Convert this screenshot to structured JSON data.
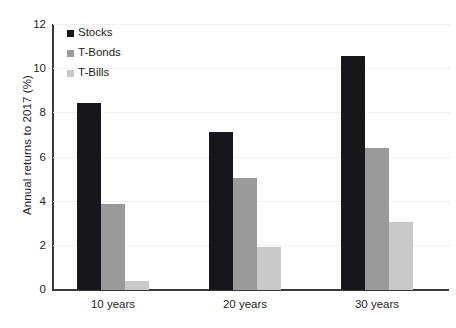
{
  "chart_data": {
    "type": "bar",
    "title": "",
    "subtitle": "",
    "xlabel": "",
    "ylabel": "Annual returns to 2017 (%)",
    "categories": [
      "10 years",
      "20 years",
      "30 years"
    ],
    "series": [
      {
        "name": "Stocks",
        "color": "#17161a",
        "values": [
          8.45,
          7.15,
          10.6
        ]
      },
      {
        "name": "T-Bonds",
        "color": "#9a9a9a",
        "values": [
          3.9,
          5.05,
          6.45
        ]
      },
      {
        "name": "T-Bills",
        "color": "#c9c9c9",
        "values": [
          0.4,
          1.95,
          3.1
        ]
      }
    ],
    "ylim": [
      0,
      12
    ],
    "yticks": [
      0,
      2,
      4,
      6,
      8,
      10,
      12
    ],
    "ytick_labels": [
      "0",
      "2",
      "4",
      "6",
      "8",
      "10",
      "12"
    ],
    "grid": true,
    "grid_axis": "y",
    "grid_color": "#e3e3e3",
    "legend_position": "top-left-inside",
    "legend_marker": "square",
    "axis_color": "#3a3a3a",
    "background": "#ffffff",
    "text_color": "#231f20"
  },
  "legend": {
    "items": [
      {
        "label": "Stocks"
      },
      {
        "label": "T-Bonds"
      },
      {
        "label": "T-Bills"
      }
    ]
  }
}
